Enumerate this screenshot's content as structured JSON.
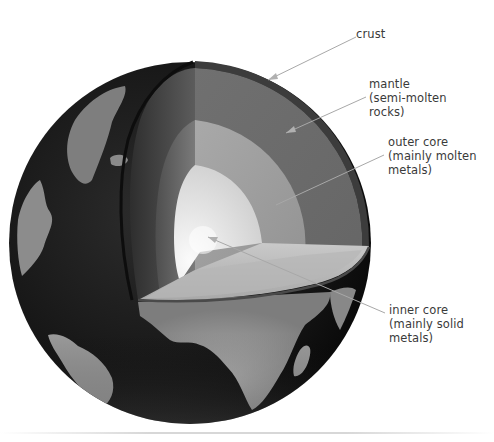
{
  "diagram": {
    "globe": {
      "center": [
        190,
        243
      ],
      "radius": 180,
      "ocean_color": "#1a1a1a",
      "land_color": "#8a8a8a"
    },
    "layers": [
      {
        "id": "crust",
        "label": "crust",
        "color": "#3c3c3c",
        "label_pos": [
          356,
          27
        ],
        "leader": {
          "from": [
            356,
            37
          ],
          "to": [
            268,
            80
          ]
        }
      },
      {
        "id": "mantle",
        "label": "mantle\n(semi-molten\nrocks)",
        "color": "#737373",
        "label_pos": [
          369,
          77
        ],
        "leader": {
          "from": [
            366,
            97
          ],
          "to": [
            286,
            133
          ]
        }
      },
      {
        "id": "outer-core",
        "label": "outer core\n(mainly molten\nmetals)",
        "color": "#a0a0a0",
        "label_pos": [
          388,
          135
        ],
        "leader": {
          "from": [
            384,
            155
          ],
          "to": [
            276,
            205
          ]
        }
      },
      {
        "id": "inner-core",
        "label": "inner core\n(mainly solid\nmetals)",
        "color": "#e6e6e6",
        "label_pos": [
          389,
          303
        ],
        "leader": {
          "from": [
            385,
            313
          ],
          "to": [
            208,
            237
          ]
        }
      }
    ],
    "leader_color": "#a8a8a8"
  }
}
